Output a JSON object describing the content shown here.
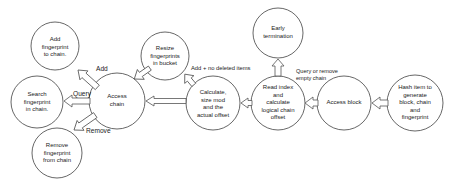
{
  "diagram": {
    "type": "flow",
    "nodes": [
      {
        "id": "hash",
        "label": "Hash item to\ngenerate\nblock, chain\nand\nfingerprint"
      },
      {
        "id": "access_block",
        "label": "Access block"
      },
      {
        "id": "read_index",
        "label": "Read index\nand\ncalculate\nlogical chain\noffset"
      },
      {
        "id": "early_termination",
        "label": "Early\ntermination"
      },
      {
        "id": "calculate",
        "label": "Calculate,\nsize mod\nand the\nactual offset"
      },
      {
        "id": "resize",
        "label": "Resize\nfingerprints\nin bucket"
      },
      {
        "id": "access_chain",
        "label": "Access\nchain"
      },
      {
        "id": "add_fp",
        "label": "Add\nfingerprint\nto chain."
      },
      {
        "id": "search_fp",
        "label": "Search\nfingerprint\nin chain."
      },
      {
        "id": "remove_fp",
        "label": "Remove\nfingerprint\nfrom chain"
      }
    ],
    "edges": [
      {
        "from": "hash",
        "to": "access_block",
        "label": ""
      },
      {
        "from": "access_block",
        "to": "read_index",
        "label": ""
      },
      {
        "from": "read_index",
        "to": "early_termination",
        "label": "Query or remove\nempty chain"
      },
      {
        "from": "read_index",
        "to": "calculate",
        "label": ""
      },
      {
        "from": "calculate",
        "to": "resize",
        "label": "Add + no deleted items"
      },
      {
        "from": "calculate",
        "to": "access_chain",
        "label": ""
      },
      {
        "from": "resize",
        "to": "access_chain",
        "label": ""
      },
      {
        "from": "access_chain",
        "to": "add_fp",
        "label": "Add"
      },
      {
        "from": "access_chain",
        "to": "search_fp",
        "label": "Query"
      },
      {
        "from": "access_chain",
        "to": "remove_fp",
        "label": "Remove"
      }
    ]
  }
}
